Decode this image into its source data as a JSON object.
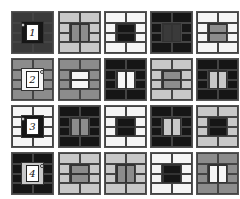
{
  "puzzle": {
    "rows": 4,
    "cols": 5,
    "colors": {
      "white": "#f5f5f5",
      "light": "#c8c8c8",
      "gray": "#8c8c8c",
      "dark": "#3a3a3a",
      "black": "#161616"
    },
    "tiles": [
      {
        "row": 0,
        "col": 0,
        "frame": "dark",
        "center": "black",
        "split": "none",
        "label": "1",
        "dot": "left"
      },
      {
        "row": 0,
        "col": 1,
        "frame": "light",
        "center": "gray",
        "split": "vertical"
      },
      {
        "row": 0,
        "col": 2,
        "frame": "white",
        "center": "black",
        "split": "horizontal"
      },
      {
        "row": 0,
        "col": 3,
        "frame": "black",
        "center": "dark",
        "split": "vertical"
      },
      {
        "row": 0,
        "col": 4,
        "frame": "white",
        "center": "gray",
        "split": "horizontal"
      },
      {
        "row": 1,
        "col": 0,
        "frame": "gray",
        "center": "white",
        "split": "none",
        "label": "2",
        "dot": "right"
      },
      {
        "row": 1,
        "col": 1,
        "frame": "gray",
        "center": "white",
        "split": "horizontal"
      },
      {
        "row": 1,
        "col": 2,
        "frame": "black",
        "center": "white",
        "split": "vertical"
      },
      {
        "row": 1,
        "col": 3,
        "frame": "light",
        "center": "gray",
        "split": "horizontal"
      },
      {
        "row": 1,
        "col": 4,
        "frame": "black",
        "center": "light",
        "split": "vertical"
      },
      {
        "row": 2,
        "col": 0,
        "frame": "white",
        "center": "black",
        "split": "none",
        "label": "3",
        "dot": "left"
      },
      {
        "row": 2,
        "col": 1,
        "frame": "black",
        "center": "gray",
        "split": "vertical"
      },
      {
        "row": 2,
        "col": 2,
        "frame": "white",
        "center": "black",
        "split": "horizontal"
      },
      {
        "row": 2,
        "col": 3,
        "frame": "black",
        "center": "light",
        "split": "vertical"
      },
      {
        "row": 2,
        "col": 4,
        "frame": "light",
        "center": "black",
        "split": "horizontal"
      },
      {
        "row": 3,
        "col": 0,
        "frame": "black",
        "center": "light",
        "split": "none",
        "label": "4",
        "dot": "right"
      },
      {
        "row": 3,
        "col": 1,
        "frame": "light",
        "center": "gray",
        "split": "horizontal"
      },
      {
        "row": 3,
        "col": 2,
        "frame": "light",
        "center": "gray",
        "split": "vertical"
      },
      {
        "row": 3,
        "col": 3,
        "frame": "white",
        "center": "black",
        "split": "horizontal"
      },
      {
        "row": 3,
        "col": 4,
        "frame": "gray",
        "center": "white",
        "split": "vertical"
      }
    ],
    "labels": [
      "1",
      "2",
      "3",
      "4"
    ]
  }
}
